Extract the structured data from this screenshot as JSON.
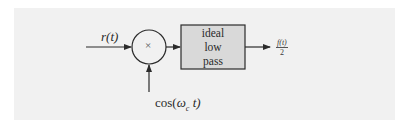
{
  "diagram": {
    "type": "block-diagram",
    "input_signal": {
      "label": "r(t)"
    },
    "multiplier": {
      "symbol": "×"
    },
    "carrier_input": {
      "label_prefix": "cos(",
      "label_omega": "ω",
      "label_sub": "c",
      "label_suffix": " t)"
    },
    "filter_block": {
      "lines": [
        "ideal",
        "low",
        "pass"
      ]
    },
    "output_signal": {
      "numerator": "f(t)",
      "denominator": "2"
    },
    "colors": {
      "background_panel": "#f1f1f1",
      "block_fill": "#d9d9d9",
      "stroke": "#2b2b2b"
    }
  }
}
